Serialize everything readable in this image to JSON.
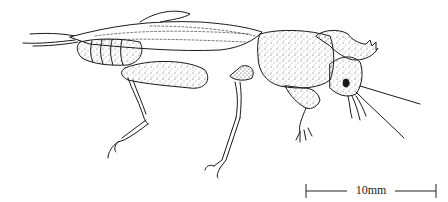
{
  "figure": {
    "style": "stippled pen-and-ink",
    "ink_color": "#1a1a1a",
    "background": "#ffffff"
  },
  "scale_bar": {
    "label": "10mm"
  }
}
